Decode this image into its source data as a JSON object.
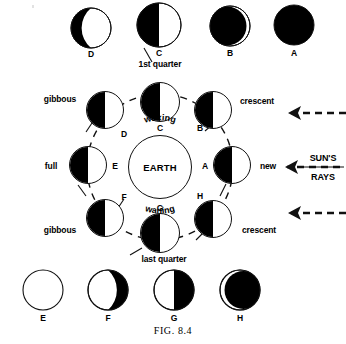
{
  "figure": {
    "caption_prefix": "F",
    "caption_rest": "IG",
    "caption_number": ". 8.4",
    "caption_full": "FIG. 8.4",
    "center_body": "EARTH",
    "arc_top": "waxing",
    "arc_bottom": "waning",
    "sun_label_top": "SUN'S",
    "sun_label_bottom": "RAYS"
  },
  "top_row": [
    {
      "id": "top-moon-D",
      "label": "D",
      "phase": "waning-crescent-dark-left",
      "cx": 91,
      "cy": 28,
      "r": 20
    },
    {
      "id": "top-moon-C",
      "label": "C",
      "phase": "half-dark-left",
      "cx": 159,
      "cy": 25,
      "r": 22
    },
    {
      "id": "top-moon-B",
      "label": "B",
      "phase": "thin-bright-crescent-right",
      "cx": 230,
      "cy": 26,
      "r": 20
    },
    {
      "id": "top-moon-A",
      "label": "A",
      "phase": "new-all-dark",
      "cx": 294,
      "cy": 25,
      "r": 20
    }
  ],
  "bottom_row": [
    {
      "id": "bottom-moon-E",
      "label": "E",
      "phase": "full-all-light",
      "cx": 43,
      "cy": 290,
      "r": 20
    },
    {
      "id": "bottom-moon-F",
      "label": "F",
      "phase": "dark-crescent-right",
      "cx": 108,
      "cy": 290,
      "r": 20
    },
    {
      "id": "bottom-moon-G",
      "label": "G",
      "phase": "half-dark-right",
      "cx": 174,
      "cy": 290,
      "r": 20
    },
    {
      "id": "bottom-moon-H",
      "label": "H",
      "phase": "thin-light-crescent-left",
      "cx": 240,
      "cy": 290,
      "r": 20
    }
  ],
  "orbit_moons": [
    {
      "id": "orbit-moon-C",
      "label": "C",
      "label_pos": "below",
      "phase_name": "1st quarter",
      "phase_pos": "above",
      "cx": 160,
      "cy": 102,
      "r": 20
    },
    {
      "id": "orbit-moon-B",
      "label": "B",
      "label_pos": "below-left",
      "phase_name": "crescent",
      "phase_pos": "right",
      "cx": 213,
      "cy": 110,
      "r": 19
    },
    {
      "id": "orbit-moon-A",
      "label": "A",
      "label_pos": "left",
      "phase_name": "new",
      "phase_pos": "right",
      "cx": 232,
      "cy": 165,
      "r": 19
    },
    {
      "id": "orbit-moon-H",
      "label": "H",
      "label_pos": "above",
      "phase_name": "crescent",
      "phase_pos": "right",
      "cx": 213,
      "cy": 219,
      "r": 19
    },
    {
      "id": "orbit-moon-G",
      "label": "G",
      "label_pos": "above",
      "phase_name": "last quarter",
      "phase_pos": "below",
      "cx": 160,
      "cy": 233,
      "r": 20
    },
    {
      "id": "orbit-moon-F",
      "label": "F",
      "label_pos": "above-right",
      "phase_name": "gibbous",
      "phase_pos": "left",
      "cx": 105,
      "cy": 218,
      "r": 19
    },
    {
      "id": "orbit-moon-E",
      "label": "E",
      "label_pos": "right",
      "phase_name": "full",
      "phase_pos": "left",
      "cx": 88,
      "cy": 165,
      "r": 19
    },
    {
      "id": "orbit-moon-D",
      "label": "D",
      "label_pos": "below-right",
      "phase_name": "gibbous",
      "phase_pos": "left",
      "cx": 105,
      "cy": 110,
      "r": 19
    }
  ],
  "sun_rays": [
    {
      "id": "sun-ray-arrow-top",
      "y": 113
    },
    {
      "id": "sun-ray-arrow-middle",
      "y": 167
    },
    {
      "id": "sun-ray-arrow-bottom",
      "y": 213
    }
  ],
  "colors": {
    "ink": "#000000",
    "paper": "#ffffff"
  }
}
